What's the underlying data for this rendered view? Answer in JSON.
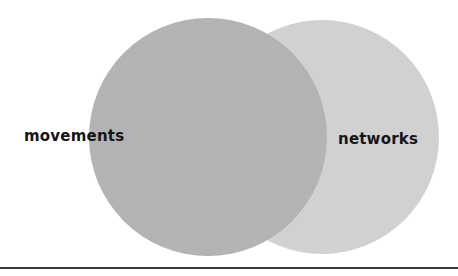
{
  "diagram": {
    "type": "venn",
    "sets": [
      {
        "label": "movements",
        "color": "#b4b4b4"
      },
      {
        "label": "networks",
        "color": "#d2d2d2"
      }
    ]
  },
  "colors": {
    "background": "#ffffff",
    "left_circle": "#b4b4b4",
    "right_circle": "#d2d2d2",
    "text": "#151515",
    "rule": "#3a3a3a"
  }
}
